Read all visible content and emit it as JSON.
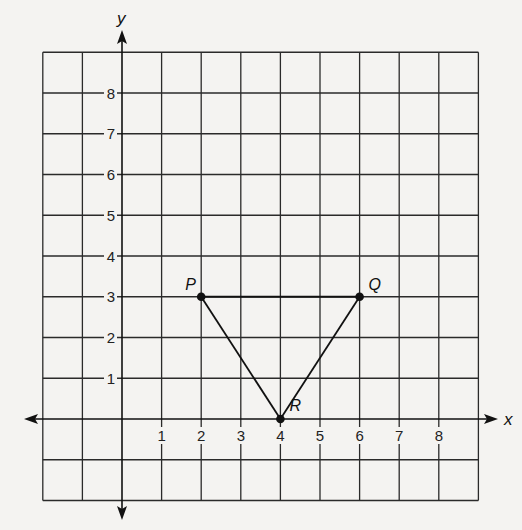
{
  "chart_data": {
    "type": "scatter",
    "title": "",
    "xlabel": "x",
    "ylabel": "y",
    "xlim": [
      -2,
      9
    ],
    "ylim": [
      -2,
      9
    ],
    "grid": true,
    "x_ticks": [
      1,
      2,
      3,
      4,
      5,
      6,
      7,
      8
    ],
    "y_ticks": [
      1,
      2,
      3,
      4,
      5,
      6,
      7,
      8
    ],
    "points": [
      {
        "label": "P",
        "x": 2,
        "y": 3
      },
      {
        "label": "Q",
        "x": 6,
        "y": 3
      },
      {
        "label": "R",
        "x": 4,
        "y": 0
      }
    ],
    "segments": [
      [
        "P",
        "Q"
      ],
      [
        "P",
        "R"
      ],
      [
        "Q",
        "R"
      ]
    ],
    "shape": "triangle PQR"
  },
  "layout": {
    "origin_px": [
      122,
      419
    ],
    "unit_x_px": 39.6,
    "unit_y_px": 40.75,
    "colors": {
      "background": "#f4f3f1",
      "grid": "#2a2a2a",
      "ink": "#111111"
    }
  }
}
